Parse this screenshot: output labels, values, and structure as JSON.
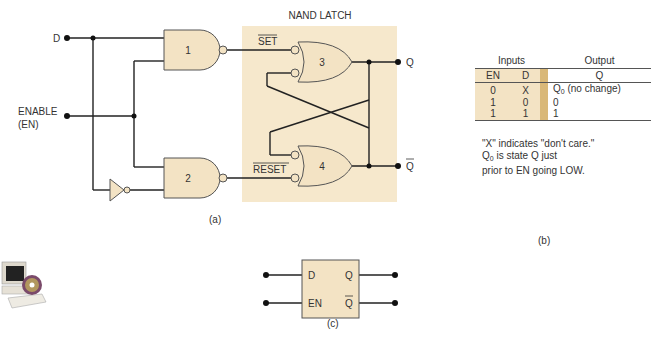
{
  "figure_a": {
    "caption": "(a)",
    "latch_title": "NAND LATCH",
    "inputs": {
      "d": "D",
      "enable_line1": "ENABLE",
      "enable_line2": "(EN)"
    },
    "gates": {
      "g1": "1",
      "g2": "2",
      "g3": "3",
      "g4": "4"
    },
    "signals": {
      "set_bar": "SET",
      "reset_bar": "RESET"
    },
    "outputs": {
      "q": "Q",
      "q_bar": "Q"
    }
  },
  "figure_b": {
    "caption": "(b)",
    "header": {
      "inputs": "Inputs",
      "output": "Output"
    },
    "columns": {
      "en": "EN",
      "d": "D",
      "q": "Q"
    },
    "rows": [
      {
        "en": "0",
        "d": "X",
        "q_main": "Q",
        "q_sub": "0",
        "q_rest": " (no change)"
      },
      {
        "en": "1",
        "d": "0",
        "q_main": "0",
        "q_sub": "",
        "q_rest": ""
      },
      {
        "en": "1",
        "d": "1",
        "q_main": "1",
        "q_sub": "",
        "q_rest": ""
      }
    ],
    "notes": {
      "line1": "\"X\" indicates \"don't care.\"",
      "line2_main": "Q",
      "line2_sub": "0",
      "line2_rest": " is state Q just",
      "line3": "prior to EN going LOW."
    }
  },
  "figure_c": {
    "caption": "(c)",
    "pins": {
      "d": "D",
      "en": "EN",
      "q": "Q",
      "q_bar": "Q"
    }
  },
  "colors": {
    "gate_fill": "#f3e3c4",
    "latch_bg": "#f6e8cc",
    "wire": "#222222",
    "table_sep": "#d9b878"
  },
  "icons": {
    "corner": "computer-cd-icon"
  }
}
